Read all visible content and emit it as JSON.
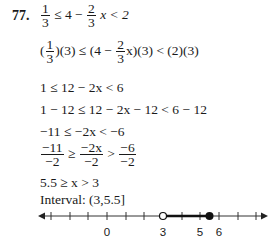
{
  "problem": {
    "number": "77.",
    "steps": {
      "s1": {
        "a_n": "1",
        "a_d": "3",
        "mid1": "≤ 4 −",
        "b_n": "2",
        "b_d": "3",
        "mid2": "x < 2"
      },
      "s2": {
        "pre": "(",
        "a_n": "1",
        "a_d": "3",
        "mid1": ")(3) ≤ (4 −",
        "b_n": "2",
        "b_d": "3",
        "mid2": "x)(3) < (2)(3)"
      },
      "s3": "1 ≤ 12 − 2x < 6",
      "s4": "1 − 12 ≤ 12 − 2x − 12 < 6 − 12",
      "s5": "−11 ≤ −2x < −6",
      "s6": {
        "a_n": "−11",
        "a_d": "−2",
        "op1": "≥",
        "b_n": "−2x",
        "b_d": "−2",
        "op2": ">",
        "c_n": "−6",
        "c_d": "−2"
      },
      "s7": "5.5 ≥ x > 3",
      "interval": "Interval:  (3,5.5]"
    }
  },
  "number_line": {
    "labels": [
      {
        "text": "0",
        "x": 107
      },
      {
        "text": "3",
        "x": 163
      },
      {
        "text": "5",
        "x": 200
      },
      {
        "text": "6",
        "x": 219
      }
    ],
    "open_point": 3,
    "closed_point": 5.5
  }
}
